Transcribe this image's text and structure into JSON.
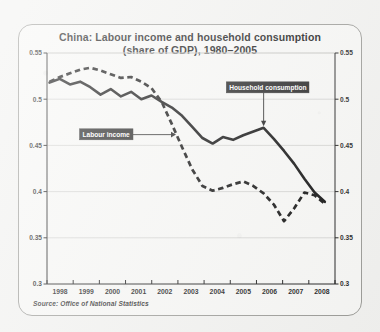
{
  "figure": {
    "title_line1": "China: Labour income and household consumption",
    "title_line2": "(share of GDP), 1980–2005",
    "source": "Source: Office of National Statistics"
  },
  "chart_data": {
    "type": "line",
    "title": "China: Labour income and household consumption (share of GDP), 1980–2005",
    "xlabel": "",
    "ylabel": "",
    "xlim": [
      1997.5,
      2008.8
    ],
    "ylim": [
      0.3,
      0.55
    ],
    "grid": true,
    "legend": "inline-annotations",
    "x_tick_labels": [
      "1998",
      "1999",
      "2000",
      "2001",
      "2002",
      "2003",
      "2004",
      "2005",
      "2006",
      "2007",
      "2008"
    ],
    "y_tick_labels": [
      "0.55",
      "0.5",
      "0.45",
      "0.4",
      "0.35",
      "0.3"
    ],
    "y_tick_values": [
      0.55,
      0.5,
      0.45,
      0.4,
      0.35,
      0.3
    ],
    "y_axis_right_labels": [
      "0.55",
      "0.5",
      "0.45",
      "0.4",
      "0.35",
      "0.3"
    ],
    "x": [
      1997.6,
      1998.0,
      1998.4,
      1998.8,
      1999.2,
      1999.6,
      2000.0,
      2000.4,
      2000.8,
      2001.2,
      2001.6,
      2002.0,
      2002.4,
      2002.8,
      2003.2,
      2003.6,
      2004.0,
      2004.4,
      2004.8,
      2005.2,
      2005.6,
      2006.0,
      2006.4,
      2006.8,
      2007.2,
      2007.6,
      2008.0,
      2008.4
    ],
    "series": [
      {
        "name": "Household consumption",
        "style": "solid",
        "color": "#0d0d0d",
        "values": [
          0.518,
          0.522,
          0.516,
          0.519,
          0.513,
          0.505,
          0.511,
          0.503,
          0.508,
          0.5,
          0.504,
          0.497,
          0.491,
          0.482,
          0.47,
          0.458,
          0.452,
          0.459,
          0.456,
          0.461,
          0.465,
          0.469,
          0.457,
          0.444,
          0.43,
          0.414,
          0.399,
          0.389
        ]
      },
      {
        "name": "Labour income",
        "style": "dashed",
        "color": "#0d0d0d",
        "values": [
          0.519,
          0.524,
          0.528,
          0.532,
          0.534,
          0.531,
          0.527,
          0.523,
          0.524,
          0.519,
          0.512,
          0.497,
          0.473,
          0.448,
          0.424,
          0.406,
          0.401,
          0.404,
          0.408,
          0.411,
          0.406,
          0.398,
          0.386,
          0.368,
          0.382,
          0.399,
          0.396,
          0.387
        ]
      }
    ],
    "annotations": [
      {
        "label": "Household consumption",
        "points_to_series": "Household consumption",
        "at_x": 2006.0,
        "at_y": 0.469
      },
      {
        "label": "Labour income",
        "points_to_series": "Labour income",
        "at_x": 2002.6,
        "at_y": 0.462
      }
    ]
  }
}
